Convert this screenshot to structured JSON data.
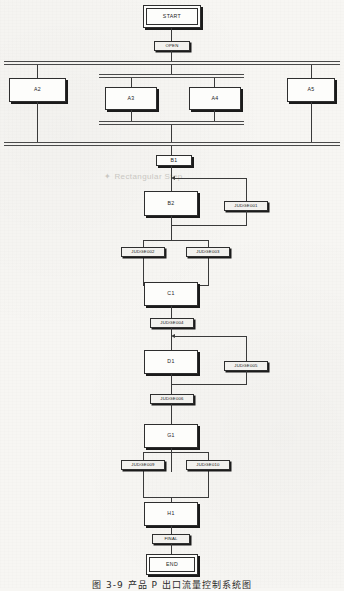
{
  "diagram": {
    "kind": "sequential-function-chart",
    "watermark": "Rectangular Step",
    "caption": "图 3-9    产品 P 出口流量控制系统图",
    "colors": {
      "page_background": "#f7f6f3",
      "line": "#3a3a3a",
      "step_fill": "#fdfdfb",
      "transition_fill": "#f2f1ee",
      "text": "#1b1b1b",
      "shadow": "#1b1b1b",
      "watermark": "#c9c7c2"
    },
    "steps": {
      "start": "START",
      "a2": "A2",
      "a3": "A3",
      "a4": "A4",
      "a5": "A5",
      "b1": "B1",
      "b2": "B2",
      "c1": "C1",
      "d1": "D1",
      "g1": "G1",
      "h1": "H1",
      "end": "END"
    },
    "transitions": {
      "open": "OPEN",
      "judge001": "JUDGE001",
      "judge002": "JUDGE002",
      "judge003": "JUDGE003",
      "judge004": "JUDGE004",
      "judge005": "JUDGE005",
      "judge006": "JUDGE006",
      "judge009": "JUDGE009",
      "judge010": "JUDGE010",
      "final": "FINAL"
    }
  }
}
